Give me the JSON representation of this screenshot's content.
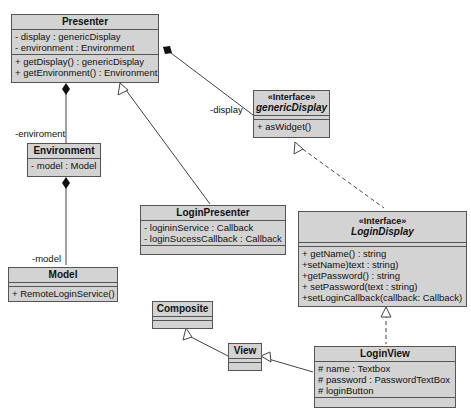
{
  "classes": {
    "presenter": {
      "name": "Presenter",
      "attributes": [
        "- display : genericDisplay",
        "- environment : Environment"
      ],
      "operations": [
        "+ getDisplay() : genericDisplay",
        "+ getEnvironment() : Environment"
      ]
    },
    "generic_display": {
      "stereotype": "«Interface»",
      "name": "genericDisplay",
      "operations": [
        "+ asWidget()"
      ]
    },
    "environment": {
      "name": "Environment",
      "attributes": [
        "- model : Model"
      ]
    },
    "model": {
      "name": "Model",
      "operations": [
        "+ RemoteLoginService()"
      ]
    },
    "login_presenter": {
      "name": "LoginPresenter",
      "attributes": [
        "- logininService : Callback",
        "- loginSucessCallback : Callback"
      ]
    },
    "login_display": {
      "stereotype": "«Interface»",
      "name": "LoginDisplay",
      "operations": [
        "+ getName() : string",
        "+setName)text : string)",
        "+getPassword() : string",
        "+ setPassword(text : string)",
        "+setLoginCallback(callback: Callback)"
      ]
    },
    "composite": {
      "name": "Composite"
    },
    "view": {
      "name": "View"
    },
    "login_view": {
      "name": "LoginView",
      "attributes": [
        "# name : Textbox",
        "# password : PasswordTextBox",
        "# loginButton"
      ]
    }
  },
  "labels": {
    "display_role": "-display",
    "environment_role": "-enviroment",
    "model_role": "-model"
  }
}
